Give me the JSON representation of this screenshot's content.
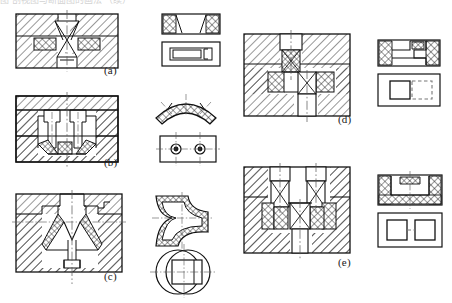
{
  "page": {
    "kind": "engineering-drawing",
    "width": 452,
    "height": 303,
    "background": "#ffffff",
    "line_color": "#111111",
    "hatch_color": "#1a1a1a",
    "centerline_color": "#555555",
    "hidden_line_color": "#777777",
    "top_cropped_caption": "图 剖视图与断面图的画法 （续）"
  },
  "figures": [
    {
      "id": "a",
      "caption": "(a)",
      "caption_x": 104,
      "caption_y": 70,
      "section_view": {
        "name": "section-view-a",
        "x": 16,
        "y": 14,
        "w": 104,
        "h": 54,
        "body_hatch": "diagonal-45",
        "insert_hatch": "cross-hatch",
        "features": [
          "upper-punch",
          "tapered-die-throat",
          "lower-ejector",
          "two-side-inserts",
          "vertical-centerline"
        ]
      },
      "aux_views": [
        {
          "name": "aux-top-section-a",
          "x": 162,
          "y": 14,
          "w": 58,
          "h": 20,
          "hatch": "cross-hatch",
          "features": [
            "end-cross-hatched-blocks",
            "central-clear-window"
          ]
        },
        {
          "name": "aux-plan-a",
          "x": 162,
          "y": 42,
          "w": 58,
          "h": 24,
          "hatch": "none",
          "features": [
            "outer-rectangle",
            "inner-rectangle",
            "small-step-notch"
          ]
        }
      ]
    },
    {
      "id": "b",
      "caption": "(b)",
      "caption_x": 104,
      "caption_y": 162,
      "section_view": {
        "name": "section-view-b",
        "x": 16,
        "y": 96,
        "w": 104,
        "h": 62,
        "body_hatch": "diagonal-45",
        "insert_hatch": "cross-hatch",
        "features": [
          "twin-vertical-punches",
          "stepped-cavity",
          "angled-corner-inserts",
          "vertical-centerline",
          "horizontal-parting-line"
        ]
      },
      "aux_views": [
        {
          "name": "aux-arc-section-b",
          "x": 156,
          "y": 96,
          "w": 64,
          "h": 30,
          "hatch": "cross-hatch",
          "features": [
            "curved-arc-band",
            "three-hatched-segments",
            "radial-centerlines"
          ]
        },
        {
          "name": "aux-plan-b",
          "x": 156,
          "y": 134,
          "w": 64,
          "h": 30,
          "hatch": "none",
          "features": [
            "outer-rectangle",
            "two-circular-holes",
            "horizontal-centerline",
            "two-vertical-centerlines"
          ]
        }
      ]
    },
    {
      "id": "c",
      "caption": "(c)",
      "caption_x": 104,
      "caption_y": 276,
      "section_view": {
        "name": "section-view-c",
        "x": 14,
        "y": 193,
        "w": 108,
        "h": 76,
        "body_hatch": "diagonal-45",
        "insert_hatch": "cross-hatch",
        "features": [
          "central-vertical-bore",
          "conical-funnel-cavity",
          "v-shaped-core",
          "stepped-shoulder",
          "lower-boss"
        ]
      },
      "aux_views": [
        {
          "name": "aux-bent-profile-c",
          "x": 156,
          "y": 192,
          "w": 54,
          "h": 42,
          "hatch": "cross-hatch",
          "features": [
            "z-bend-tube-section",
            "wall-thickness-hatched"
          ]
        },
        {
          "name": "aux-circle-plan-c",
          "x": 152,
          "y": 238,
          "w": 62,
          "h": 56,
          "hatch": "none",
          "features": [
            "large-circle",
            "offset-circle",
            "inner-square",
            "cross-centerlines"
          ]
        }
      ]
    },
    {
      "id": "d",
      "caption": "(d)",
      "caption_x": 340,
      "caption_y": 119,
      "section_view": {
        "name": "section-view-d",
        "x": 244,
        "y": 33,
        "w": 106,
        "h": 82,
        "body_hatch": "diagonal-45",
        "insert_hatch": "cross-hatch",
        "features": [
          "upper-punch-boss",
          "x-hatched-upper-insert",
          "x-hatched-lower-insert",
          "offset-lower-punch",
          "two-vertical-centerlines"
        ]
      },
      "aux_views": [
        {
          "name": "aux-top-section-d",
          "x": 379,
          "y": 41,
          "w": 62,
          "h": 26,
          "hatch": "cross-hatch",
          "features": [
            "end-cross-hatched-blocks",
            "stepped-internal-outline"
          ]
        },
        {
          "name": "aux-plan-d",
          "x": 379,
          "y": 75,
          "w": 62,
          "h": 32,
          "hatch": "none",
          "features": [
            "outer-rectangle",
            "solid-square",
            "dashed-hidden-square"
          ]
        }
      ]
    },
    {
      "id": "e",
      "caption": "(e)",
      "caption_x": 340,
      "caption_y": 262,
      "section_view": {
        "name": "section-view-e",
        "x": 244,
        "y": 166,
        "w": 106,
        "h": 86,
        "body_hatch": "diagonal-45",
        "insert_hatch": "cross-hatch",
        "features": [
          "two-upper-punches",
          "x-hatched-inserts",
          "central-lower-punch",
          "lower-boss",
          "three-vertical-centerlines"
        ]
      },
      "aux_views": [
        {
          "name": "aux-top-section-e",
          "x": 379,
          "y": 176,
          "w": 64,
          "h": 30,
          "hatch": "cross-hatch",
          "features": [
            "u-shaped-cross-hatched-frame",
            "top-centre-hatched-tab"
          ]
        },
        {
          "name": "aux-plan-e",
          "x": 379,
          "y": 214,
          "w": 64,
          "h": 34,
          "hatch": "none",
          "features": [
            "outer-rectangle",
            "two-solid-squares",
            "dashed-centre-line"
          ]
        }
      ]
    }
  ]
}
